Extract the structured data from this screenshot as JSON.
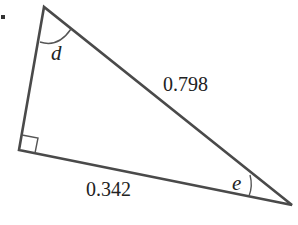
{
  "diagram": {
    "type": "right-triangle",
    "colors": {
      "stroke": "#4a4a4a",
      "text": "#222222",
      "background": "#ffffff"
    },
    "vertices": {
      "top": {
        "x": 44,
        "y": 7
      },
      "right_angle": {
        "x": 19,
        "y": 150
      },
      "far_right": {
        "x": 292,
        "y": 205
      }
    },
    "sides": {
      "hypotenuse": {
        "label": "0.798"
      },
      "bottom_leg": {
        "label": "0.342"
      }
    },
    "angles": {
      "top": {
        "label": "d"
      },
      "right": {
        "label": "e"
      },
      "corner": {
        "label": "right-angle"
      }
    }
  }
}
